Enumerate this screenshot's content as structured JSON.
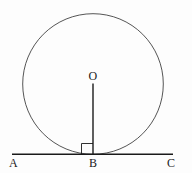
{
  "diagram": {
    "labels": {
      "center": "O",
      "left_point": "A",
      "tangent_point": "B",
      "right_point": "C"
    },
    "elements": {
      "circle": {
        "cx": 93,
        "cy": 84,
        "r": 70
      },
      "radius_segment": {
        "from": "O",
        "to": "B"
      },
      "tangent_line": {
        "from": "A",
        "to": "C"
      },
      "right_angle_marker": {
        "at": "B"
      }
    },
    "colors": {
      "stroke": "#2a2a2a",
      "background": "#fdfdfd"
    }
  }
}
